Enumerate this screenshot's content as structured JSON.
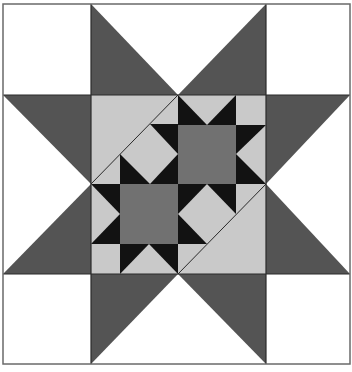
{
  "figure": {
    "type": "quilt-block",
    "colors": {
      "background": "#ffffff",
      "outer_star_points": "#545454",
      "center_field": "#c9c9c9",
      "mini_star_points": "#121212",
      "mini_star_centers": "#717171",
      "seam_lines": "#2a2a2a",
      "border": "#6a6a6a"
    },
    "frame": {
      "x0": 3,
      "y0": 4,
      "x1": 350,
      "y1": 364
    },
    "grid_x": [
      3,
      91,
      266,
      350
    ],
    "grid_y": [
      4,
      95,
      274,
      364
    ],
    "outer_points": [
      [
        [
          91,
          4
        ],
        [
          91,
          95
        ],
        [
          178,
          95
        ]
      ],
      [
        [
          266,
          4
        ],
        [
          266,
          95
        ],
        [
          178,
          95
        ]
      ],
      [
        [
          3,
          95
        ],
        [
          91,
          95
        ],
        [
          91,
          184
        ]
      ],
      [
        [
          3,
          274
        ],
        [
          91,
          274
        ],
        [
          91,
          184
        ]
      ],
      [
        [
          350,
          95
        ],
        [
          266,
          95
        ],
        [
          266,
          184
        ]
      ],
      [
        [
          350,
          274
        ],
        [
          266,
          274
        ],
        [
          266,
          184
        ]
      ],
      [
        [
          91,
          364
        ],
        [
          91,
          274
        ],
        [
          178,
          274
        ]
      ],
      [
        [
          266,
          364
        ],
        [
          266,
          274
        ],
        [
          178,
          274
        ]
      ]
    ],
    "center_square": {
      "x": 91,
      "y": 95,
      "w": 175,
      "h": 179
    },
    "mini_star_centers": [
      {
        "name": "upper-right-star-center",
        "x": 178,
        "y": 125,
        "w": 58,
        "h": 59
      },
      {
        "name": "lower-left-star-center",
        "x": 120,
        "y": 184,
        "w": 58,
        "h": 60
      }
    ],
    "black_points": [
      [
        [
          178,
          95
        ],
        [
          178,
          125
        ],
        [
          207,
          125
        ]
      ],
      [
        [
          236,
          95
        ],
        [
          236,
          125
        ],
        [
          207,
          125
        ]
      ],
      [
        [
          236,
          125
        ],
        [
          266,
          125
        ],
        [
          236,
          154
        ]
      ],
      [
        [
          236,
          154
        ],
        [
          266,
          184
        ],
        [
          236,
          184
        ]
      ],
      [
        [
          150,
          124
        ],
        [
          178,
          124
        ],
        [
          178,
          154
        ]
      ],
      [
        [
          150,
          184
        ],
        [
          178,
          154
        ],
        [
          178,
          184
        ]
      ],
      [
        [
          120,
          154
        ],
        [
          120,
          184
        ],
        [
          150,
          184
        ]
      ],
      [
        [
          178,
          184
        ],
        [
          207,
          184
        ],
        [
          178,
          214
        ]
      ],
      [
        [
          207,
          184
        ],
        [
          236,
          184
        ],
        [
          236,
          214
        ]
      ],
      [
        [
          178,
          214
        ],
        [
          178,
          244
        ],
        [
          207,
          244
        ]
      ],
      [
        [
          91,
          184
        ],
        [
          120,
          184
        ],
        [
          120,
          214
        ]
      ],
      [
        [
          91,
          244
        ],
        [
          120,
          244
        ],
        [
          120,
          214
        ]
      ],
      [
        [
          120,
          244
        ],
        [
          149,
          244
        ],
        [
          120,
          274
        ]
      ],
      [
        [
          149,
          244
        ],
        [
          178,
          244
        ],
        [
          178,
          274
        ]
      ]
    ],
    "diagonal_seams": [
      [
        [
          178,
          95
        ],
        [
          91,
          184
        ]
      ],
      [
        [
          266,
          184
        ],
        [
          178,
          274
        ]
      ]
    ],
    "caption": ""
  }
}
